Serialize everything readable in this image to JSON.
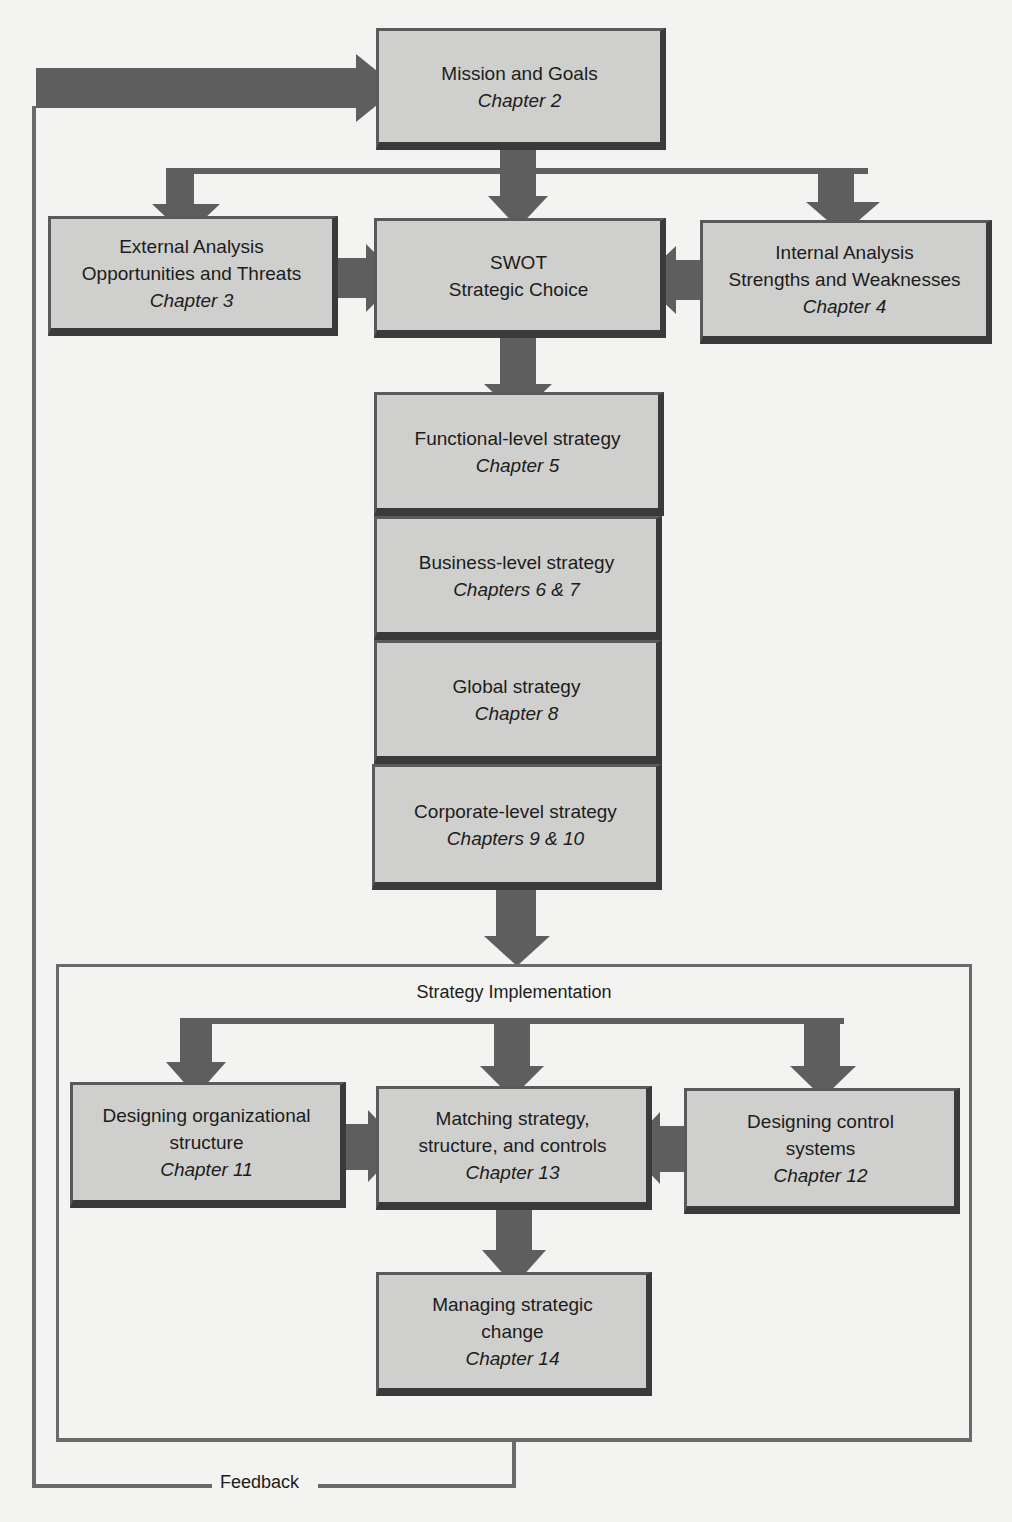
{
  "diagram": {
    "type": "flowchart",
    "nodes": {
      "mission": {
        "title": "Mission and Goals",
        "chapter": "Chapter 2"
      },
      "external": {
        "line1": "External Analysis",
        "line2": "Opportunities and Threats",
        "chapter": "Chapter 3"
      },
      "swot": {
        "line1": "SWOT",
        "line2": "Strategic Choice"
      },
      "internal": {
        "line1": "Internal Analysis",
        "line2": "Strengths and Weaknesses",
        "chapter": "Chapter 4"
      },
      "functional": {
        "title": "Functional-level strategy",
        "chapter": "Chapter 5"
      },
      "business": {
        "title": "Business-level strategy",
        "chapter": "Chapters 6 & 7"
      },
      "global": {
        "title": "Global strategy",
        "chapter": "Chapter 8"
      },
      "corporate": {
        "title": "Corporate-level strategy",
        "chapter": "Chapters 9 & 10"
      },
      "org_structure": {
        "line1": "Designing organizational",
        "line2": "structure",
        "chapter": "Chapter 11"
      },
      "matching": {
        "line1": "Matching strategy,",
        "line2": "structure, and controls",
        "chapter": "Chapter 13"
      },
      "control": {
        "line1": "Designing control",
        "line2": "systems",
        "chapter": "Chapter 12"
      },
      "change": {
        "line1": "Managing strategic",
        "line2": "change",
        "chapter": "Chapter 14"
      }
    },
    "groups": {
      "implementation": {
        "title": "Strategy Implementation"
      }
    },
    "feedback": {
      "label": "Feedback"
    },
    "colors": {
      "box_fill": "#cfcfcd",
      "box_border": "#5a5a5a",
      "arrow": "#5e5e5e",
      "line": "#6a6a6a",
      "background": "#f3f3f2"
    }
  }
}
